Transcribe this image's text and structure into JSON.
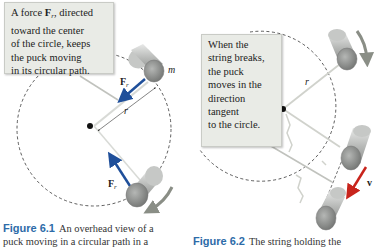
{
  "figure_1": {
    "callout_lines": [
      "A force F_r, directed",
      "toward the center",
      "of the circle, keeps",
      "the puck moving",
      "in its circular path."
    ],
    "callout_line1_prefix": "A force ",
    "callout_line1_vector": "F",
    "callout_line1_subscript": "r",
    "callout_line1_suffix": ", directed",
    "labels": {
      "mass": "m",
      "radius": "r",
      "force_top": "F",
      "force_top_sub": "r",
      "force_bottom": "F",
      "force_bottom_sub": "r"
    },
    "caption": {
      "number": "Figure 6.1",
      "text": "An overhead view of a",
      "text_line2": "puck moving in a circular path in a"
    }
  },
  "figure_2": {
    "callout_lines": [
      "When the",
      "string breaks,",
      "the puck",
      "moves in the",
      "direction",
      "tangent",
      "to the circle."
    ],
    "labels": {
      "radius": "r",
      "velocity": "v"
    },
    "caption": {
      "number": "Figure 6.2",
      "text": "The string holding the"
    }
  },
  "colors": {
    "force_arrow": "#1f4f9a",
    "velocity_arrow": "#c8241c",
    "motion_arrow": "#8a8e86",
    "caption_number": "#2d6ba8",
    "callout_bg": "#e9ebe6",
    "puck": "#9a9c9a"
  }
}
